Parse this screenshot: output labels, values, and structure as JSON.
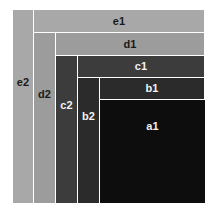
{
  "figure": {
    "background_color": "#ffffff",
    "separator_color": "#ffffff",
    "canvas": {
      "width": 215,
      "height": 214
    }
  },
  "chart_data": {
    "type": "treemap",
    "xlabel": "",
    "ylabel": "",
    "grid": false,
    "legend": "none",
    "plot_area": {
      "x": 13,
      "y": 10,
      "width": 192,
      "height": 193
    },
    "labels": [
      "e1",
      "e2",
      "d1",
      "d2",
      "c1",
      "c2",
      "b1",
      "b2",
      "a1"
    ],
    "values": [
      4224,
      3957,
      4048,
      3234,
      3278,
      2610,
      2914,
      2266,
      10815
    ],
    "blocks": [
      {
        "label": "e1",
        "role": "horizontal-band",
        "level": "e",
        "color": "#a8a8a8",
        "label_color": "#1a1a1a",
        "x": 34,
        "y": 10,
        "width": 171,
        "height": 23
      },
      {
        "label": "e2",
        "role": "vertical-band",
        "level": "e",
        "color": "#a8a8a8",
        "label_color": "#1a1a1a",
        "x": 13,
        "y": 10,
        "width": 21,
        "height": 193
      },
      {
        "label": "d1",
        "role": "horizontal-band",
        "level": "d",
        "color": "#9c9c9c",
        "label_color": "#1a1a1a",
        "x": 56,
        "y": 33,
        "width": 149,
        "height": 23
      },
      {
        "label": "d2",
        "role": "vertical-band",
        "level": "d",
        "color": "#9c9c9c",
        "label_color": "#1a1a1a",
        "x": 34,
        "y": 33,
        "width": 22,
        "height": 170
      },
      {
        "label": "c1",
        "role": "horizontal-band",
        "level": "c",
        "color": "#3c3c3c",
        "label_color": "#f2f2f2",
        "x": 78,
        "y": 56,
        "width": 127,
        "height": 22
      },
      {
        "label": "c2",
        "role": "vertical-band",
        "level": "c",
        "color": "#3c3c3c",
        "label_color": "#f2f2f2",
        "x": 56,
        "y": 56,
        "width": 22,
        "height": 147
      },
      {
        "label": "b1",
        "role": "horizontal-band",
        "level": "b",
        "color": "#2b2b2b",
        "label_color": "#f2f2f2",
        "x": 100,
        "y": 78,
        "width": 105,
        "height": 22
      },
      {
        "label": "b2",
        "role": "vertical-band",
        "level": "b",
        "color": "#2b2b2b",
        "label_color": "#f2f2f2",
        "x": 78,
        "y": 78,
        "width": 22,
        "height": 125
      },
      {
        "label": "a1",
        "role": "core",
        "level": "a",
        "color": "#0d0d0d",
        "label_color": "#f2f2f2",
        "x": 100,
        "y": 100,
        "width": 105,
        "height": 103
      }
    ]
  }
}
